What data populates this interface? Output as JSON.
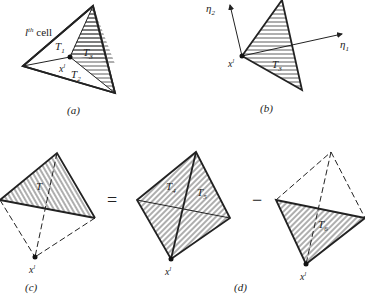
{
  "figure": {
    "panels": [
      {
        "id": "a",
        "caption": "(a)",
        "cell_label": "l",
        "cell_label_sup": "th",
        "cell_label_suffix": " cell",
        "point_label": "x",
        "point_sup": "l",
        "triangles": [
          {
            "label": "T",
            "sub": "1",
            "hatched": false
          },
          {
            "label": "T",
            "sub": "2",
            "hatched": false
          },
          {
            "label": "T",
            "sub": "3",
            "hatched": true
          }
        ]
      },
      {
        "id": "b",
        "caption": "(b)",
        "point_label": "x",
        "point_sup": "l",
        "axes": [
          {
            "label": "η",
            "sub": "1"
          },
          {
            "label": "η",
            "sub": "2"
          }
        ],
        "triangles": [
          {
            "label": "T",
            "sub": "3",
            "hatched": true
          }
        ]
      },
      {
        "id": "c",
        "caption": "(c)",
        "point_label": "x",
        "point_sup": "l",
        "triangles": [
          {
            "label": "T",
            "sub": "",
            "hatched": true
          }
        ]
      },
      {
        "id": "d",
        "caption": "(d)",
        "point_label": "x",
        "point_sup": "l",
        "triangles": [
          {
            "label": "T",
            "sub": "4",
            "hatched": true
          },
          {
            "label": "T",
            "sub": "5",
            "hatched": true
          },
          {
            "label": "T",
            "sub": "6",
            "hatched": true
          }
        ]
      }
    ],
    "operators": {
      "equals": "=",
      "minus": "−"
    }
  }
}
